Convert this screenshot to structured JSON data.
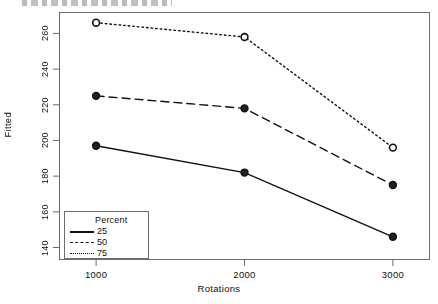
{
  "chart_data": {
    "type": "line",
    "title": "",
    "xlabel": "Rotations",
    "ylabel": "Fitted",
    "x": [
      1000,
      2000,
      3000
    ],
    "xticks": [
      "1000",
      "2000",
      "3000"
    ],
    "yticks": [
      "140",
      "160",
      "180",
      "200",
      "220",
      "240",
      "260"
    ],
    "xlim": [
      750,
      3250
    ],
    "ylim": [
      133,
      272
    ],
    "grid": false,
    "legend": {
      "title": "Percent",
      "position": "bottom-left",
      "entries": [
        {
          "label": "25",
          "style": "solid"
        },
        {
          "label": "50",
          "style": "dashed"
        },
        {
          "label": "75",
          "style": "dotted"
        }
      ]
    },
    "series": [
      {
        "name": "25",
        "style": "solid",
        "marker": "circle-filled",
        "values": [
          197,
          182,
          146
        ]
      },
      {
        "name": "50",
        "style": "dashed",
        "marker": "circle-filled",
        "values": [
          225,
          218,
          175
        ]
      },
      {
        "name": "75",
        "style": "dotted",
        "marker": "circle-open",
        "values": [
          266,
          258,
          196
        ]
      }
    ]
  },
  "colors": {
    "line": "#111111",
    "frame": "#6d6d6d",
    "background": "#ffffff"
  }
}
